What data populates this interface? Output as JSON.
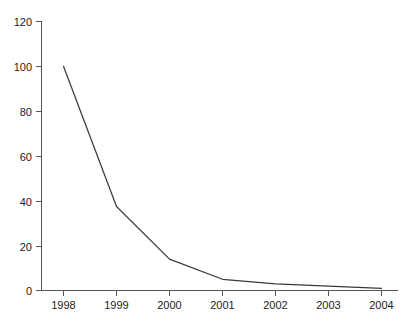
{
  "chart_data": {
    "type": "line",
    "title": "",
    "subtitle": "",
    "xlabel": "",
    "ylabel": "",
    "categories": [
      "1998",
      "1999",
      "2000",
      "2001",
      "2002",
      "2003",
      "2004"
    ],
    "values": [
      100,
      37.5,
      14,
      5,
      3,
      2,
      1
    ],
    "series": [
      {
        "name": "",
        "values": [
          100,
          37.5,
          14,
          5,
          3,
          2,
          1
        ]
      }
    ],
    "ylim": [
      0,
      120
    ],
    "y_ticks": [
      0,
      20,
      40,
      60,
      80,
      100,
      120
    ],
    "y_tick_labels": [
      "0",
      "20",
      "40",
      "60",
      "80",
      "100",
      "120"
    ],
    "x_tick_labels": [
      "1998",
      "1999",
      "2000",
      "2001",
      "2002",
      "2003",
      "2004"
    ],
    "grid": false,
    "legend": false,
    "legend_position": "none",
    "markers": false,
    "annotations": []
  },
  "colors": {
    "background": "#ffffff",
    "series_line": "#3a3a3a",
    "axis": "#555555",
    "tick_label": "#1c1c1c"
  },
  "axis_labels": {
    "y": [
      "120",
      "100",
      "80",
      "60",
      "40",
      "20",
      "0"
    ],
    "x": [
      "1998",
      "1999",
      "2000",
      "2001",
      "2002",
      "2003",
      "2004"
    ]
  }
}
